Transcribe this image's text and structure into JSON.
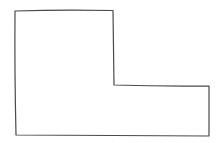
{
  "diagram": {
    "type": "hand-drawn outline",
    "shape": "L-shape",
    "stroke_color": "#4a4a4a",
    "background_color": "#ffffff",
    "vertex_count": 6,
    "labels": []
  }
}
